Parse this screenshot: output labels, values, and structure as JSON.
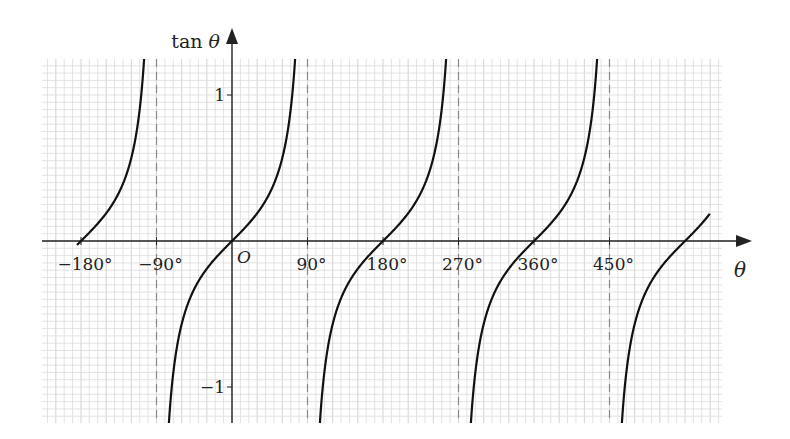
{
  "chart_data": {
    "type": "line",
    "title": "",
    "xlabel": "θ",
    "ylabel": "tan θ",
    "function": "tan",
    "x_ticks": [
      -180,
      -90,
      90,
      180,
      270,
      360,
      450
    ],
    "x_tick_labels": [
      "−180°",
      "−90°",
      "90°",
      "180°",
      "270°",
      "360°",
      "450°"
    ],
    "y_ticks": [
      1,
      -1
    ],
    "y_tick_labels": [
      "1",
      "−1"
    ],
    "origin_label": "O",
    "asymptotes": [
      -90,
      90,
      270,
      450
    ],
    "xlim": [
      -195,
      585
    ],
    "domain": [
      -185,
      570
    ],
    "grid": true,
    "colors": {
      "curve": "#111111",
      "axis": "#222222",
      "grid_minor": "#dcdcdc",
      "grid_major": "#c8c8c8",
      "asymptote": "#888888"
    }
  }
}
